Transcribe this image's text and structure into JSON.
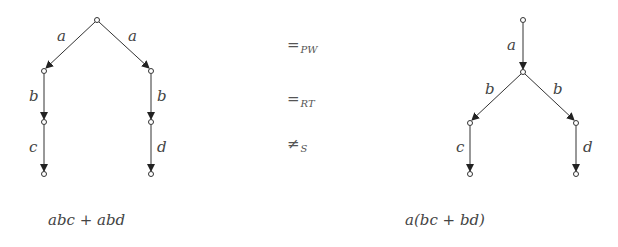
{
  "left_tree": {
    "edge_labels": [
      "a",
      "a",
      "b",
      "b",
      "c",
      "d"
    ],
    "expression": "abc + abd"
  },
  "right_tree": {
    "edge_labels": [
      "a",
      "b",
      "b",
      "c",
      "d"
    ],
    "expression": "a(bc + bd)"
  },
  "relations": [
    {
      "symbol": "=",
      "subscript": "PW"
    },
    {
      "symbol": "=",
      "subscript": "RT"
    },
    {
      "symbol": "≠",
      "subscript": "S"
    }
  ],
  "colors": {
    "line": "#333333",
    "text": "#444444"
  }
}
